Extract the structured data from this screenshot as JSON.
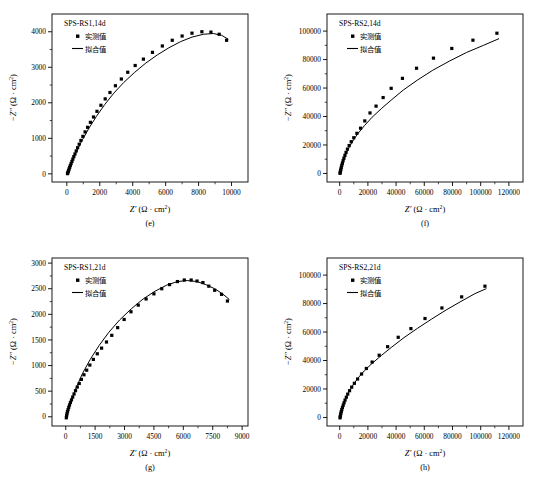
{
  "figure": {
    "name": "EIS Nyquist plots SPS-RS 14d and 21d",
    "axis_color": "#000000",
    "marker_color": "#000000",
    "fit_color": "#000000"
  },
  "labels": {
    "xlabel_symbol": "Z",
    "xlabel_prime": "′",
    "ylabel_symbol": "−Z",
    "ylabel_prime": "″",
    "unit_open": "(Ω · cm",
    "unit_sup": "2",
    "unit_close": ")",
    "legend_measured": "实测值",
    "legend_fitted": "拟合值"
  },
  "chart_data": [
    {
      "panel": "e",
      "caption": "(e)",
      "type": "scatter",
      "title": "SPS-RS1,14d",
      "xlabel": "Z′ (Ω · cm2)",
      "ylabel": "−Z″ (Ω · cm2)",
      "xlim": [
        -900,
        11000
      ],
      "ylim": [
        -230,
        4500
      ],
      "xticks": [
        0,
        2000,
        4000,
        6000,
        8000,
        10000
      ],
      "yticks": [
        0,
        1000,
        2000,
        3000,
        4000
      ],
      "xtick_labels": [
        "0",
        "2000",
        "4000",
        "6000",
        "8000",
        "10000"
      ],
      "ytick_labels": [
        "0",
        "1000",
        "2000",
        "3000",
        "4000"
      ],
      "xminor": 1,
      "yminor": 1,
      "grid": false,
      "legend_position": "top-left",
      "series": [
        {
          "name": "实测值",
          "marker": "square",
          "x": [
            40,
            60,
            85,
            110,
            140,
            175,
            215,
            260,
            310,
            365,
            425,
            495,
            570,
            655,
            750,
            855,
            975,
            1110,
            1260,
            1430,
            1620,
            1830,
            2070,
            2330,
            2620,
            2950,
            3310,
            3700,
            4150,
            4650,
            5200,
            5800,
            6400,
            7000,
            7600,
            8200,
            8750,
            9250,
            9700
          ],
          "y": [
            5,
            30,
            65,
            100,
            140,
            185,
            235,
            290,
            350,
            415,
            485,
            560,
            645,
            735,
            835,
            940,
            1055,
            1180,
            1310,
            1450,
            1600,
            1760,
            1930,
            2110,
            2290,
            2480,
            2670,
            2860,
            3050,
            3230,
            3420,
            3600,
            3760,
            3880,
            3960,
            4000,
            3990,
            3930,
            3760
          ]
        },
        {
          "name": "拟合值",
          "marker": "line",
          "x": [
            40,
            300,
            600,
            950,
            1350,
            1800,
            2300,
            2850,
            3450,
            4100,
            4800,
            5500,
            6200,
            6900,
            7600,
            8300,
            8900,
            9400,
            9800
          ],
          "y": [
            0,
            330,
            640,
            960,
            1290,
            1620,
            1950,
            2270,
            2570,
            2850,
            3120,
            3350,
            3550,
            3720,
            3850,
            3930,
            3950,
            3900,
            3790
          ]
        }
      ]
    },
    {
      "panel": "f",
      "caption": "(f)",
      "type": "scatter",
      "title": "SPS-RS2,14d",
      "xlabel": "Z′ (Ω · cm2)",
      "ylabel": "−Z″ (Ω · cm2)",
      "xlim": [
        -9000,
        130000
      ],
      "ylim": [
        -6000,
        112000
      ],
      "xticks": [
        0,
        20000,
        40000,
        60000,
        80000,
        100000,
        120000
      ],
      "yticks": [
        0,
        20000,
        40000,
        60000,
        80000,
        100000
      ],
      "xtick_labels": [
        "0",
        "20000",
        "40000",
        "60000",
        "80000",
        "100000",
        "120000"
      ],
      "ytick_labels": [
        "0",
        "20000",
        "40000",
        "60000",
        "80000",
        "100000"
      ],
      "xminor": 1,
      "yminor": 1,
      "grid": false,
      "legend_position": "top-left",
      "series": [
        {
          "name": "实测值",
          "marker": "square",
          "x": [
            250,
            400,
            600,
            850,
            1150,
            1500,
            1900,
            2400,
            3000,
            3700,
            4500,
            5500,
            6700,
            8200,
            10000,
            12200,
            14800,
            17800,
            21500,
            25800,
            30800,
            36500,
            44500,
            54500,
            66500,
            79500,
            94500,
            111500
          ],
          "y": [
            100,
            900,
            1900,
            3000,
            4300,
            5700,
            7200,
            8900,
            10700,
            12700,
            14800,
            17100,
            19600,
            22300,
            25100,
            28200,
            31800,
            36900,
            42500,
            47300,
            53300,
            59800,
            66800,
            73900,
            81000,
            87800,
            93600,
            98500
          ]
        },
        {
          "name": "拟合值",
          "marker": "line",
          "x": [
            250,
            1200,
            2800,
            5200,
            8500,
            12500,
            17500,
            23000,
            29500,
            36500,
            45000,
            55000,
            66000,
            78000,
            90000,
            102000,
            113000
          ],
          "y": [
            0,
            4200,
            9500,
            15500,
            21500,
            27500,
            33500,
            39500,
            45500,
            51500,
            58500,
            65500,
            72500,
            79000,
            85000,
            90000,
            94700
          ]
        }
      ]
    },
    {
      "panel": "g",
      "caption": "(g)",
      "type": "scatter",
      "title": "SPS-RS1,21d",
      "xlabel": "Z′ (Ω · cm2)",
      "ylabel": "−Z″ (Ω · cm2)",
      "xlim": [
        -700,
        9300
      ],
      "ylim": [
        -180,
        3100
      ],
      "xticks": [
        0,
        1500,
        3000,
        4500,
        6000,
        7500,
        9000
      ],
      "yticks": [
        0,
        500,
        1000,
        1500,
        2000,
        2500,
        3000
      ],
      "xtick_labels": [
        "0",
        "1500",
        "3000",
        "4500",
        "6000",
        "7500",
        "9000"
      ],
      "ytick_labels": [
        "0",
        "500",
        "1000",
        "1500",
        "2000",
        "2500",
        "3000"
      ],
      "xminor": 1,
      "yminor": 1,
      "grid": false,
      "legend_position": "top-left",
      "series": [
        {
          "name": "实测值",
          "marker": "square",
          "x": [
            30,
            45,
            65,
            90,
            120,
            155,
            195,
            240,
            295,
            355,
            425,
            500,
            590,
            690,
            800,
            930,
            1070,
            1230,
            1410,
            1610,
            1830,
            2080,
            2350,
            2650,
            2980,
            3330,
            3700,
            4100,
            4500,
            4900,
            5300,
            5700,
            6050,
            6400,
            6700,
            7000,
            7300,
            7600,
            7950,
            8250
          ],
          "y": [
            -20,
            20,
            60,
            100,
            140,
            185,
            230,
            280,
            330,
            385,
            445,
            510,
            580,
            650,
            730,
            820,
            910,
            1010,
            1120,
            1230,
            1340,
            1460,
            1590,
            1740,
            1900,
            2050,
            2180,
            2300,
            2400,
            2500,
            2580,
            2640,
            2670,
            2670,
            2650,
            2620,
            2550,
            2470,
            2390,
            2260
          ]
        },
        {
          "name": "拟合值",
          "marker": "line",
          "x": [
            30,
            250,
            520,
            850,
            1250,
            1700,
            2200,
            2750,
            3350,
            3950,
            4550,
            5150,
            5700,
            6200,
            6700,
            7150,
            7600,
            8000,
            8350
          ],
          "y": [
            0,
            280,
            560,
            840,
            1120,
            1390,
            1650,
            1890,
            2110,
            2300,
            2450,
            2570,
            2640,
            2660,
            2640,
            2580,
            2500,
            2400,
            2290
          ]
        }
      ]
    },
    {
      "panel": "h",
      "caption": "(h)",
      "type": "scatter",
      "title": "SPS-RS2,21d",
      "xlabel": "Z′ (Ω · cm2)",
      "ylabel": "−Z″ (Ω · cm2)",
      "xlim": [
        -9000,
        130000
      ],
      "ylim": [
        -6000,
        112000
      ],
      "xticks": [
        0,
        20000,
        40000,
        60000,
        80000,
        100000,
        120000
      ],
      "yticks": [
        0,
        20000,
        40000,
        60000,
        80000,
        100000
      ],
      "xtick_labels": [
        "0",
        "20000",
        "40000",
        "60000",
        "80000",
        "100000",
        "120000"
      ],
      "ytick_labels": [
        "0",
        "20000",
        "40000",
        "60000",
        "80000",
        "100000"
      ],
      "xminor": 1,
      "yminor": 1,
      "grid": false,
      "legend_position": "top-left",
      "series": [
        {
          "name": "实测值",
          "marker": "square",
          "x": [
            250,
            400,
            600,
            850,
            1150,
            1500,
            1950,
            2500,
            3100,
            3800,
            4700,
            5700,
            7000,
            8500,
            10400,
            12700,
            15500,
            18900,
            23000,
            28000,
            34000,
            41500,
            50500,
            60500,
            72500,
            86500,
            103000
          ],
          "y": [
            -300,
            700,
            1800,
            3000,
            4200,
            5500,
            7000,
            8600,
            10300,
            12200,
            14200,
            16400,
            18800,
            21300,
            24000,
            27000,
            30500,
            34400,
            38900,
            43700,
            49700,
            56300,
            62400,
            69500,
            76900,
            84700,
            92200
          ]
        },
        {
          "name": "拟合值",
          "marker": "line",
          "x": [
            250,
            1300,
            3000,
            5500,
            8800,
            12800,
            17500,
            23000,
            29500,
            37000,
            45500,
            55000,
            65000,
            75500,
            86000,
            96000,
            104000
          ],
          "y": [
            0,
            4500,
            10000,
            16000,
            21800,
            27500,
            32800,
            38000,
            43500,
            49500,
            56000,
            62500,
            69000,
            75500,
            81500,
            87000,
            90500
          ]
        }
      ]
    }
  ]
}
